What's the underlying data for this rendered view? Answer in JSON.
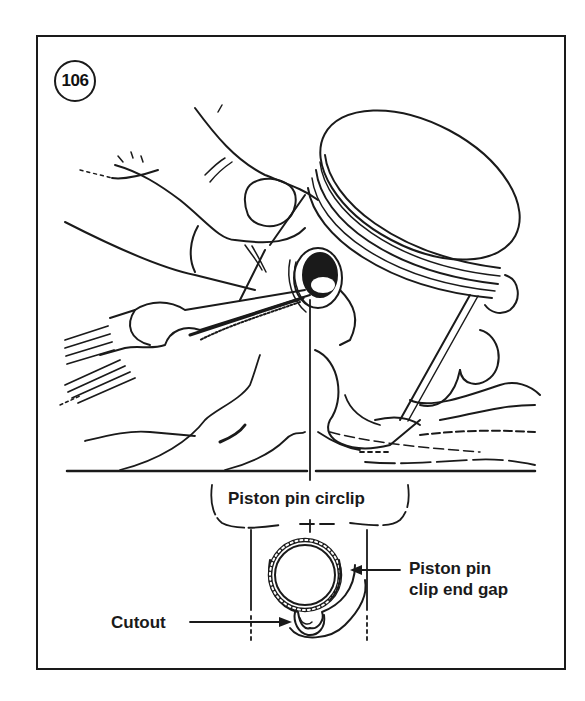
{
  "figure": {
    "number": "106",
    "stroke_color": "#1a1a1a",
    "background_color": "#ffffff"
  },
  "labels": {
    "circlip": "Piston pin circlip",
    "gap_line1": "Piston pin",
    "gap_line2": "clip end gap",
    "cutout": "Cutout"
  },
  "icons": {
    "figure_badge": "circled-number",
    "arrows": "arrow-right, arrow-left"
  }
}
